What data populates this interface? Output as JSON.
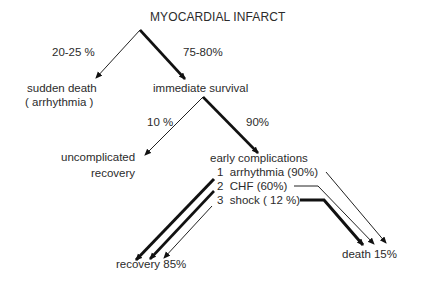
{
  "diagram": {
    "title": "MYOCARDIAL INFARCT",
    "branch1": {
      "left": {
        "percent": "20-25 %",
        "outcome_line1": "sudden death",
        "outcome_line2": "( arrhythmia )"
      },
      "right": {
        "percent": "75-80%",
        "outcome": "immediate survival"
      }
    },
    "branch2": {
      "left": {
        "percent": "10 %",
        "outcome_line1": "uncomplicated",
        "outcome_line2": "recovery"
      },
      "right": {
        "percent": "90%",
        "outcome": "early complications"
      }
    },
    "complications": [
      {
        "index": "1",
        "label": "arrhythmia (90%)"
      },
      {
        "index": "2",
        "label": "CHF  (60%)"
      },
      {
        "index": "3",
        "label": "shock  ( 12 %)"
      }
    ],
    "final_outcomes": {
      "recovery": "recovery  85%",
      "death": "death 15%"
    },
    "colors": {
      "line": "#111111",
      "text": "#2b2b2b",
      "background": "#ffffff"
    }
  }
}
